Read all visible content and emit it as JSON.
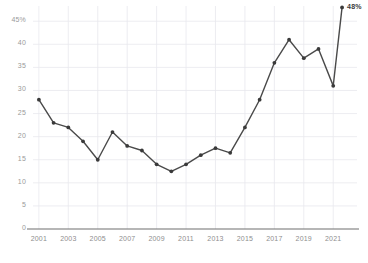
{
  "chart_data": {
    "type": "line",
    "title": "",
    "subtitle": "",
    "xlabel": "",
    "ylabel": "",
    "x": [
      2001,
      2002,
      2003,
      2004,
      2005,
      2006,
      2007,
      2008,
      2009,
      2010,
      2011,
      2012,
      2013,
      2014,
      2015,
      2016,
      2017,
      2018,
      2019,
      2020,
      2021
    ],
    "values": [
      28,
      23,
      22,
      19,
      15,
      21,
      18,
      17,
      14,
      12.5,
      14,
      16,
      17.5,
      16.5,
      22,
      28,
      36,
      41,
      37,
      39,
      31
    ],
    "final_point": {
      "x": 2021.6,
      "value": 48,
      "label": "48%"
    },
    "xlim": [
      2000.6,
      2021.8
    ],
    "ylim": [
      0,
      47
    ],
    "ytick_values": [
      0,
      5,
      10,
      15,
      20,
      25,
      30,
      35,
      40,
      45
    ],
    "ytick_labels": [
      "0",
      "5",
      "10",
      "15",
      "20",
      "25",
      "30",
      "35",
      "40",
      "45%"
    ],
    "xtick_values": [
      2001,
      2003,
      2005,
      2007,
      2009,
      2011,
      2013,
      2015,
      2017,
      2019,
      2021
    ],
    "xtick_labels": [
      "2001",
      "2003",
      "2005",
      "2007",
      "2009",
      "2011",
      "2013",
      "2015",
      "2017",
      "2019",
      "2021"
    ],
    "grid": true,
    "legend": "none",
    "markers": true,
    "line_color": "#4a4a4a",
    "marker_color": "#3a3a3a",
    "grid_color": "#e8e8ee",
    "axis_color": "#6e6e6e",
    "tick_text_color": "#9a9a9a"
  },
  "caption": ""
}
